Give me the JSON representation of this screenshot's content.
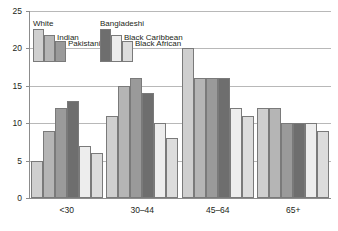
{
  "chart_data": {
    "type": "bar",
    "title": "",
    "subtitle": "",
    "xlabel": "",
    "ylabel": "",
    "categories": [
      "<30",
      "30–44",
      "45–64",
      "65+"
    ],
    "ylim": [
      0,
      25
    ],
    "yticks": [
      "0",
      "5",
      "10",
      "15",
      "20",
      "25"
    ],
    "ytick_values": [
      0,
      5,
      10,
      15,
      20,
      25
    ],
    "grid": true,
    "legend_position": "top-left-inside",
    "series": [
      {
        "name": "White",
        "values": [
          5,
          11,
          20,
          12
        ],
        "color": "#cfcfcf"
      },
      {
        "name": "Indian",
        "values": [
          9,
          15,
          16,
          12
        ],
        "color": "#b5b5b5"
      },
      {
        "name": "Pakistani",
        "values": [
          12,
          16,
          16,
          10
        ],
        "color": "#9a9a9a"
      },
      {
        "name": "Bangladeshi",
        "values": [
          13,
          14,
          16,
          10
        ],
        "color": "#6e6e6e"
      },
      {
        "name": "Black Caribbean",
        "values": [
          7,
          10,
          12,
          10
        ],
        "color": "#ededed"
      },
      {
        "name": "Black African",
        "values": [
          6,
          8,
          11,
          9
        ],
        "color": "#dcdcdc"
      }
    ]
  },
  "legend": {
    "groups": [
      {
        "entries": [
          {
            "label": "White",
            "color": "#cfcfcf"
          },
          {
            "label": "Indian",
            "color": "#b5b5b5"
          },
          {
            "label": "Pakistani",
            "color": "#9a9a9a"
          }
        ]
      },
      {
        "entries": [
          {
            "label": "Bangladeshi",
            "color": "#6e6e6e"
          },
          {
            "label": "Black Caribbean",
            "color": "#ededed"
          },
          {
            "label": "Black African",
            "color": "#dcdcdc"
          }
        ]
      }
    ]
  },
  "colors": {
    "axis": "#8c8c8c",
    "grid": "#b8b8b8",
    "text": "#231f20",
    "bar_outline": "#7a7a7a",
    "background": "#ffffff"
  }
}
